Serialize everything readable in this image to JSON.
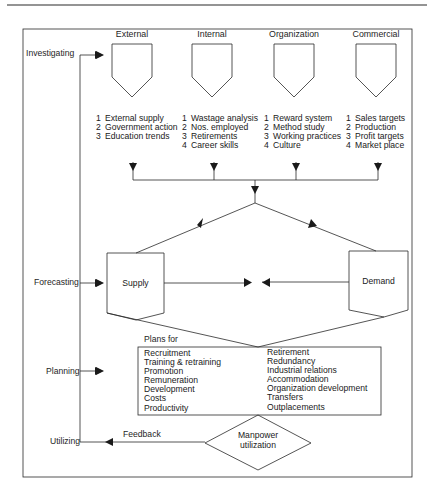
{
  "stages": {
    "investigating": "Investigating",
    "forecasting": "Forecasting",
    "planning": "Planning",
    "utilizing": "Utilizing"
  },
  "sources": [
    {
      "heading": "External",
      "items": [
        {
          "n": "1",
          "label": "External supply"
        },
        {
          "n": "2",
          "label": "Government action"
        },
        {
          "n": "3",
          "label": "Education trends"
        }
      ]
    },
    {
      "heading": "Internal",
      "items": [
        {
          "n": "1",
          "label": "Wastage analysis"
        },
        {
          "n": "2",
          "label": "Nos. employed"
        },
        {
          "n": "3",
          "label": "Retirements"
        },
        {
          "n": "4",
          "label": "Career skills"
        }
      ]
    },
    {
      "heading": "Organization",
      "items": [
        {
          "n": "1",
          "label": "Reward system"
        },
        {
          "n": "2",
          "label": "Method study"
        },
        {
          "n": "3",
          "label": "Working practices"
        },
        {
          "n": "4",
          "label": "Culture"
        }
      ]
    },
    {
      "heading": "Commercial",
      "items": [
        {
          "n": "1",
          "label": "Sales targets"
        },
        {
          "n": "2",
          "label": "Production"
        },
        {
          "n": "3",
          "label": "Profit targets"
        },
        {
          "n": "4",
          "label": "Market place"
        }
      ]
    }
  ],
  "forecast": {
    "supply": "Supply",
    "demand": "Demand"
  },
  "plans": {
    "title": "Plans for",
    "left": [
      "Recruitment",
      "Training & retraining",
      "Promotion",
      "Remuneration",
      "Development",
      "Costs",
      "Productivity"
    ],
    "right": [
      "Retirement",
      "Redundancy",
      "Industrial relations",
      "Accommodation",
      "Organization development",
      "Transfers",
      "Outplacements"
    ]
  },
  "utilization": {
    "line1": "Manpower",
    "line2": "utilization",
    "feedback": "Feedback"
  },
  "colors": {
    "line": "#2a2a2a",
    "background": "#ffffff"
  }
}
